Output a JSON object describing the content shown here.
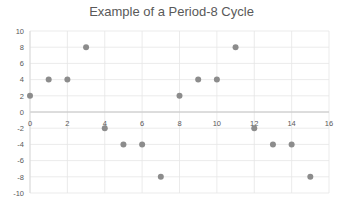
{
  "chart_data": {
    "type": "scatter",
    "title": "Example of a Period-8 Cycle",
    "xlabel": "",
    "ylabel": "",
    "xlim": [
      0,
      16
    ],
    "ylim": [
      -10,
      10
    ],
    "x_ticks": [
      0,
      2,
      4,
      6,
      8,
      10,
      12,
      14,
      16
    ],
    "y_ticks": [
      10,
      8,
      6,
      4,
      2,
      0,
      -2,
      -4,
      -6,
      -8,
      -10
    ],
    "grid": true,
    "legend": null,
    "marker_color": "#8c8c8c",
    "series": [
      {
        "name": "Series1",
        "x": [
          0,
          1,
          2,
          3,
          4,
          5,
          6,
          7,
          8,
          9,
          10,
          11,
          12,
          13,
          14,
          15
        ],
        "y": [
          2,
          4,
          4,
          8,
          -2,
          -4,
          -4,
          -8,
          2,
          4,
          4,
          8,
          -2,
          -4,
          -4,
          -8
        ]
      }
    ]
  }
}
